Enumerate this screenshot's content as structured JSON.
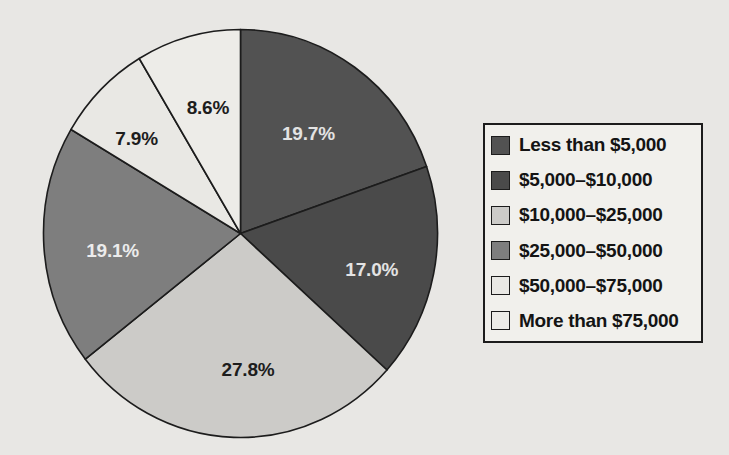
{
  "chart_data": {
    "type": "pie",
    "unit": "percent",
    "start_angle_deg": 0,
    "direction": "clockwise",
    "legend_position": "right",
    "grid": false,
    "title": "",
    "series": [
      {
        "label": "Less than $5,000",
        "value": 19.7,
        "pct_label": "19.7%",
        "color": "#525252",
        "label_color": "#e3e3e3"
      },
      {
        "label": "$5,000–$10,000",
        "value": 17.0,
        "pct_label": "17.0%",
        "color": "#4a4a4a",
        "label_color": "#e3e3e3"
      },
      {
        "label": "$10,000–$25,000",
        "value": 27.8,
        "pct_label": "27.8%",
        "color": "#cccbc8",
        "label_color": "#1d1d1d"
      },
      {
        "label": "$25,000–$50,000",
        "value": 19.1,
        "pct_label": "19.1%",
        "color": "#7e7e7e",
        "label_color": "#ececec"
      },
      {
        "label": "$50,000–$75,000",
        "value": 7.9,
        "pct_label": "7.9%",
        "color": "#e9e8e4",
        "label_color": "#1d1d1d"
      },
      {
        "label": "More than $75,000",
        "value": 8.6,
        "pct_label": "8.6%",
        "color": "#edece8",
        "label_color": "#1d1d1d"
      }
    ]
  }
}
